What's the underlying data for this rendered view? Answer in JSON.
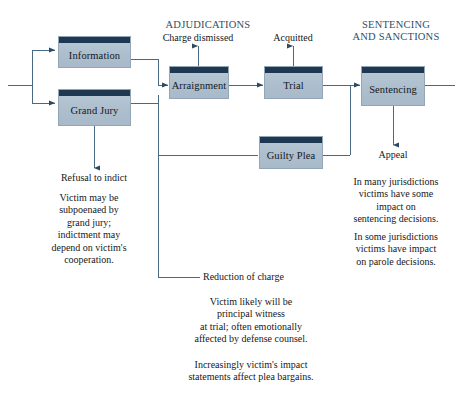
{
  "diagram": {
    "title_sections": [
      {
        "name": "adjudications",
        "text": "ADJUDICATIONS"
      },
      {
        "name": "sentencing-and-sanctions",
        "text": "SENTENCING\nAND SANCTIONS"
      }
    ],
    "nodes": [
      {
        "name": "information",
        "label": "Information"
      },
      {
        "name": "grand-jury",
        "label": "Grand Jury"
      },
      {
        "name": "arraignment",
        "label": "Arraignment"
      },
      {
        "name": "trial",
        "label": "Trial"
      },
      {
        "name": "guilty-plea",
        "label": "Guilty Plea"
      },
      {
        "name": "sentencing",
        "label": "Sentencing"
      }
    ],
    "outcome_labels": [
      {
        "name": "charge-dismissed",
        "text": "Charge dismissed"
      },
      {
        "name": "acquitted",
        "text": "Acquitted"
      },
      {
        "name": "refusal-to-indict",
        "text": "Refusal to indict"
      },
      {
        "name": "reduction-of-charge",
        "text": "Reduction of charge"
      },
      {
        "name": "appeal",
        "text": "Appeal"
      }
    ],
    "annotations": [
      {
        "name": "grand-jury-note",
        "text": "Victim may be\nsubpoenaed by\ngrand jury;\nindictment may\ndepend on victim's\ncooperation."
      },
      {
        "name": "sentencing-note",
        "text": "In many jurisdictions\nvictims have some\nimpact on\nsentencing decisions."
      },
      {
        "name": "parole-note",
        "text": "In some jurisdictions\nvictims have impact\non parole decisions."
      },
      {
        "name": "trial-witness-note",
        "text": "Victim likely will be\nprincipal witness\nat trial; often emotionally\naffected by defense counsel."
      },
      {
        "name": "plea-bargain-note",
        "text": "Increasingly victim's impact\nstatements affect plea bargains."
      }
    ],
    "colors": {
      "node_header": "#1d3850",
      "node_body": "#adbecd",
      "section_header_text": "#2e4f68",
      "connector": "#4a6a84",
      "body_text": "#15181b"
    }
  }
}
